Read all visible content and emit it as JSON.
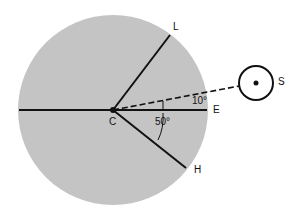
{
  "diagram": {
    "labels": {
      "L": "L",
      "E": "E",
      "H": "H",
      "C": "C",
      "S": "S",
      "angle_small": "10°",
      "angle_large": "50°"
    },
    "colors": {
      "disc": "#c4c4c4",
      "line": "#111111",
      "background": "#ffffff"
    }
  }
}
